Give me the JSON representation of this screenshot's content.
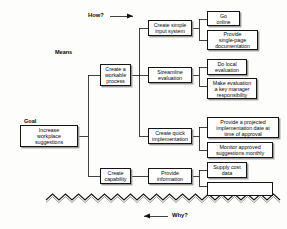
{
  "diagram": {
    "type": "tree-diagram",
    "direction_labels": {
      "top": "How?",
      "bottom": "Why?",
      "top_arrow": "right-arrow-icon",
      "bottom_arrow": "left-arrow-icon"
    },
    "captions": {
      "goal": "Goal",
      "means": "Means"
    },
    "nodes": [
      {
        "id": "goal",
        "label": "Increase\nworkplace\nsuggestions"
      },
      {
        "id": "means1",
        "label": "Create a\nworkable\nprocess"
      },
      {
        "id": "means2",
        "label": "Create\ncapability"
      },
      {
        "id": "l2a",
        "label": "Create simple\ninput system"
      },
      {
        "id": "l2b",
        "label": "Streamline\nevaluation"
      },
      {
        "id": "l2c",
        "label": "Create quick\nimplementation"
      },
      {
        "id": "l2d",
        "label": "Provide\ninformation"
      },
      {
        "id": "l3a",
        "label": "Go\nonline"
      },
      {
        "id": "l3b",
        "label": "Provide\nsingle-page\ndocumentation"
      },
      {
        "id": "l3c",
        "label": "Do local\nevaluation"
      },
      {
        "id": "l3d",
        "label": "Make evaluation\na key manager\nresponsibility"
      },
      {
        "id": "l3e",
        "label": "Provide a projected\nimplementation date at\ntime of approval"
      },
      {
        "id": "l3f",
        "label": "Monitor approved\nsuggestions monthly"
      },
      {
        "id": "l3g",
        "label": "Supply cost\ndata"
      },
      {
        "id": "l3h",
        "label": ""
      }
    ],
    "colors": {
      "line": "#141414",
      "box_fill": "#ffffff",
      "text": "#0a0a0a",
      "shadow": "#9a9a9a",
      "background": "#fdfdfc"
    }
  }
}
